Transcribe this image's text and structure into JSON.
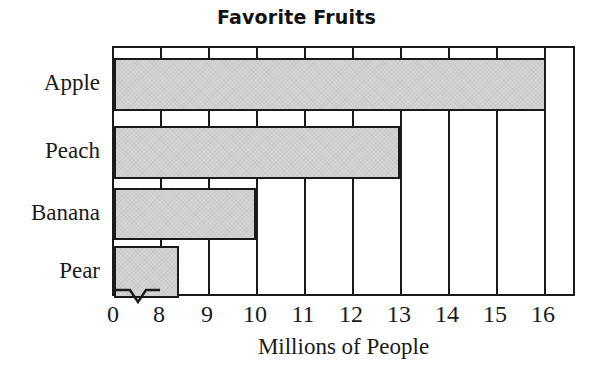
{
  "chart_data": {
    "type": "bar",
    "orientation": "horizontal",
    "title": "Favorite Fruits",
    "xlabel": "Millions of People",
    "ylabel": "",
    "categories": [
      "Apple",
      "Peach",
      "Banana",
      "Pear"
    ],
    "values": [
      16.35,
      13,
      10,
      8.35
    ],
    "xticks": [
      0,
      8,
      9,
      10,
      11,
      12,
      13,
      14,
      15,
      16
    ],
    "xtick_labels": [
      "0",
      "8",
      "9",
      "10",
      "11",
      "12",
      "13",
      "14",
      "15",
      "16"
    ],
    "xlim": [
      7.0,
      16.98
    ],
    "axis_break": true,
    "axis_break_note": "zigzag break on x-axis between 0 and 8",
    "grid": true,
    "grid_axis": "x",
    "legend": false,
    "series": [
      {
        "name": "Millions of People",
        "values": [
          16.35,
          13,
          10,
          8.35
        ]
      }
    ],
    "bar_fill_color": "#d4d4d4",
    "bar_edge_color": "#1a1a1a",
    "axis_color": "#1a1a1a",
    "background_color": "#ffffff"
  },
  "bars": [
    {
      "label": "Apple",
      "value": 16.35,
      "width_px": 432,
      "top_px": 10,
      "height_px": 53
    },
    {
      "label": "Peach",
      "value": 13,
      "width_px": 286,
      "top_px": 78,
      "height_px": 53
    },
    {
      "label": "Banana",
      "value": 10,
      "width_px": 142,
      "top_px": 140,
      "height_px": 52
    },
    {
      "label": "Pear",
      "value": 8.35,
      "width_px": 65,
      "top_px": 198,
      "height_px": 52
    }
  ],
  "gridlines": [
    {
      "label": "8",
      "x_px": 46
    },
    {
      "label": "9",
      "x_px": 94
    },
    {
      "label": "10",
      "x_px": 142
    },
    {
      "label": "11",
      "x_px": 190
    },
    {
      "label": "12",
      "x_px": 238
    },
    {
      "label": "13",
      "x_px": 286
    },
    {
      "label": "14",
      "x_px": 334
    },
    {
      "label": "15",
      "x_px": 382
    },
    {
      "label": "16",
      "x_px": 430
    }
  ],
  "tick_positions": [
    {
      "label": "0",
      "x_px": 113
    },
    {
      "label": "8",
      "x_px": 159
    },
    {
      "label": "9",
      "x_px": 207
    },
    {
      "label": "10",
      "x_px": 255
    },
    {
      "label": "11",
      "x_px": 303
    },
    {
      "label": "12",
      "x_px": 351
    },
    {
      "label": "13",
      "x_px": 399
    },
    {
      "label": "14",
      "x_px": 447
    },
    {
      "label": "15",
      "x_px": 495
    },
    {
      "label": "16",
      "x_px": 543
    }
  ],
  "category_label_positions": [
    {
      "label": "Apple",
      "top_px": 25
    },
    {
      "label": "Peach",
      "top_px": 93
    },
    {
      "label": "Banana",
      "top_px": 155
    },
    {
      "label": "Pear",
      "top_px": 213
    }
  ]
}
